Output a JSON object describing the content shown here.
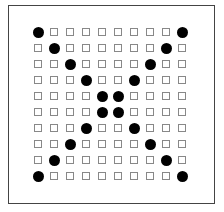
{
  "board": {
    "rows": 10,
    "cols": 10,
    "colors": {
      "dot": "#000000",
      "empty_border": "#888888",
      "frame": "#444444"
    },
    "cells": [
      [
        1,
        0,
        0,
        0,
        0,
        0,
        0,
        0,
        0,
        1
      ],
      [
        0,
        1,
        0,
        0,
        0,
        0,
        0,
        0,
        1,
        0
      ],
      [
        0,
        0,
        1,
        0,
        0,
        0,
        0,
        1,
        0,
        0
      ],
      [
        0,
        0,
        0,
        1,
        0,
        0,
        1,
        0,
        0,
        0
      ],
      [
        0,
        0,
        0,
        0,
        1,
        1,
        0,
        0,
        0,
        0
      ],
      [
        0,
        0,
        0,
        0,
        1,
        1,
        0,
        0,
        0,
        0
      ],
      [
        0,
        0,
        0,
        1,
        0,
        0,
        1,
        0,
        0,
        0
      ],
      [
        0,
        0,
        1,
        0,
        0,
        0,
        0,
        1,
        0,
        0
      ],
      [
        0,
        1,
        0,
        0,
        0,
        0,
        0,
        0,
        1,
        0
      ],
      [
        1,
        0,
        0,
        0,
        0,
        0,
        0,
        0,
        0,
        1
      ]
    ],
    "legend": {
      "1": "filled-dot",
      "0": "empty-square"
    }
  }
}
